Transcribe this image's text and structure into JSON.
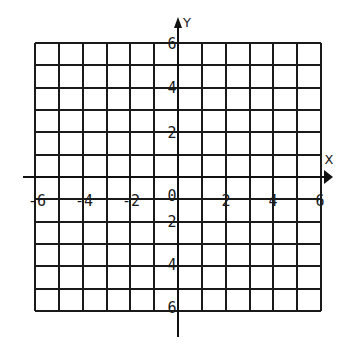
{
  "chart_data": {
    "type": "coordinate_grid",
    "title": "",
    "xlabel": "X",
    "ylabel": "Y",
    "xlim": [
      -6,
      6
    ],
    "ylim": [
      -6,
      6
    ],
    "grid": true,
    "grid_step": 1,
    "x_tick_labels": [
      "-6",
      "-4",
      "-2",
      "0",
      "2",
      "4",
      "6"
    ],
    "y_tick_labels_positive": [
      "6",
      "4",
      "2"
    ],
    "y_tick_labels_negative": [
      "2",
      "4",
      "6"
    ],
    "origin_label": "0",
    "axis_arrows": [
      "positive-x",
      "positive-y"
    ]
  },
  "axes": {
    "x_name": "X",
    "y_name": "Y"
  },
  "labels": {
    "x": [
      {
        "text": "-6",
        "x": 37,
        "y": 201
      },
      {
        "text": "-4",
        "x": 84,
        "y": 201
      },
      {
        "text": "-2",
        "x": 131,
        "y": 201
      },
      {
        "text": "2",
        "x": 226,
        "y": 201
      },
      {
        "text": "4",
        "x": 273,
        "y": 201
      },
      {
        "text": "6",
        "x": 320,
        "y": 201
      }
    ],
    "origin": {
      "text": "0",
      "x": 172,
      "y": 196
    },
    "y": [
      {
        "text": "6",
        "x": 172,
        "y": 44
      },
      {
        "text": "4",
        "x": 172,
        "y": 88
      },
      {
        "text": "2",
        "x": 172,
        "y": 133
      },
      {
        "text": "2",
        "x": 172,
        "y": 222
      },
      {
        "text": "4",
        "x": 172,
        "y": 265
      },
      {
        "text": "6",
        "x": 172,
        "y": 308
      }
    ]
  },
  "colors": {
    "ink": "#1a1a1a",
    "paper": "#ffffff"
  }
}
